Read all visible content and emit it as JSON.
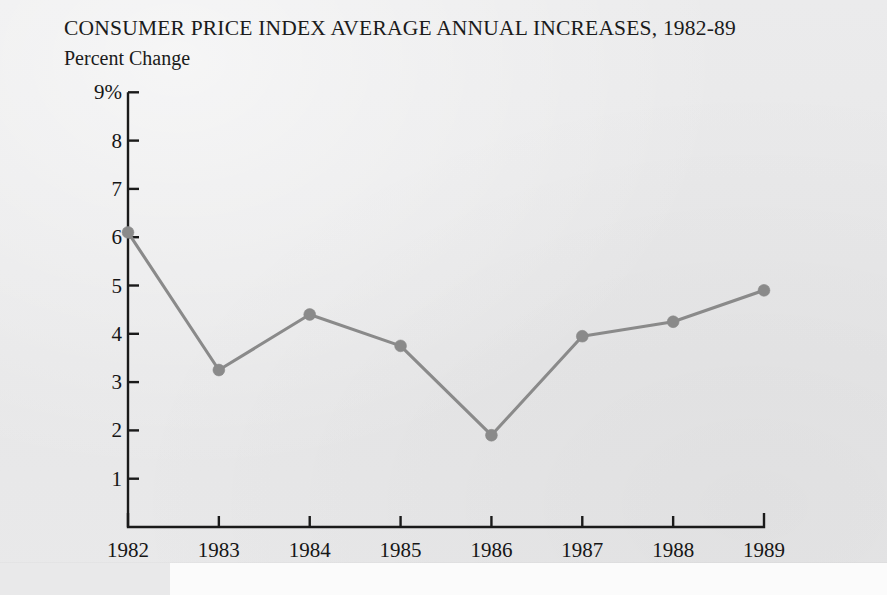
{
  "figure": {
    "title": "CONSUMER PRICE INDEX AVERAGE ANNUAL INCREASES, 1982-89",
    "subtitle": "Percent Change",
    "background_color": "#e9e9ea",
    "line_color": "#8a8a8a",
    "marker_color": "#8a8a8a",
    "axis_color": "#1a1a1a",
    "text_color": "#161616"
  },
  "chart_data": {
    "type": "line",
    "title": "CONSUMER PRICE INDEX AVERAGE ANNUAL INCREASES, 1982-89",
    "subtitle": "Percent Change",
    "xlabel": "",
    "ylabel": "Percent Change",
    "categories": [
      "1982",
      "1983",
      "1984",
      "1985",
      "1986",
      "1987",
      "1988",
      "1989"
    ],
    "x": [
      1982,
      1983,
      1984,
      1985,
      1986,
      1987,
      1988,
      1989
    ],
    "values": [
      6.1,
      3.25,
      4.4,
      3.75,
      1.9,
      3.95,
      4.25,
      4.9
    ],
    "series": [
      {
        "name": "Consumer Price Index average annual increase",
        "values": [
          6.1,
          3.25,
          4.4,
          3.75,
          1.9,
          3.95,
          4.25,
          4.9
        ]
      }
    ],
    "ylim": [
      0,
      9
    ],
    "xlim": [
      1982,
      1989
    ],
    "ytick_values": [
      9,
      8,
      7,
      6,
      5,
      4,
      3,
      2,
      1
    ],
    "ytick_labels": [
      "9%",
      "8",
      "7",
      "6",
      "5",
      "4",
      "3",
      "2",
      "1"
    ],
    "xtick_labels": [
      "1982",
      "1983",
      "1984",
      "1985",
      "1986",
      "1987",
      "1988",
      "1989"
    ],
    "grid": false,
    "legend": "none",
    "markers": "filled-circle",
    "annotations": []
  }
}
